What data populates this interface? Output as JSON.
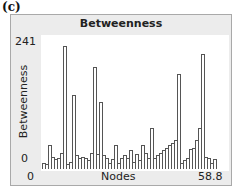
{
  "panel_label": "(c)",
  "chart_data": {
    "type": "bar",
    "title": "Betweenness",
    "xlabel": "Nodes",
    "ylabel": "Betweenness",
    "x_tick_labels": [
      "0",
      "58.8"
    ],
    "y_tick_labels": [
      "0",
      "241"
    ],
    "xlim": [
      0,
      58.8
    ],
    "ylim": [
      0,
      241
    ],
    "grid": false,
    "legend": null,
    "values": [
      10,
      8,
      45,
      22,
      18,
      20,
      30,
      241,
      8,
      12,
      145,
      25,
      20,
      22,
      20,
      15,
      30,
      200,
      28,
      130,
      25,
      20,
      10,
      18,
      45,
      10,
      20,
      25,
      20,
      35,
      12,
      28,
      15,
      45,
      30,
      20,
      80,
      20,
      25,
      30,
      35,
      40,
      45,
      50,
      55,
      185,
      10,
      15,
      20,
      38,
      40,
      55,
      80,
      225,
      22,
      20,
      10,
      18
    ]
  }
}
